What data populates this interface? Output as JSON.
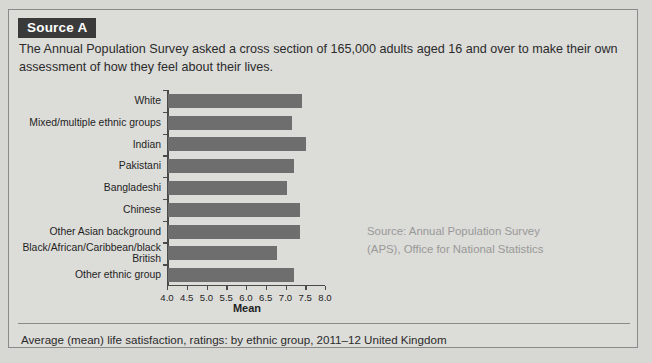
{
  "source": {
    "badge_label": "Source A",
    "intro_text": "The Annual Population Survey asked a cross section of 165,000 adults aged 16 and over to make their own assessment of how they feel about their lives.",
    "attribution_line1": "Source: Annual Population Survey",
    "attribution_line2": "(APS), Office for National Statistics",
    "caption": "Average (mean) life satisfaction, ratings: by ethnic group, 2011–12 United Kingdom"
  },
  "colors": {
    "bar": "#6e6e6e",
    "badge_bg": "#3a3a3a",
    "badge_text": "#ffffff",
    "panel_bg": "#dcdcd9",
    "border": "#8a8a88",
    "axis": "#4a4a4a",
    "attribution_text": "#999997"
  },
  "chart_data": {
    "type": "bar",
    "orientation": "horizontal",
    "title": "",
    "xlabel": "Mean",
    "ylabel": "",
    "xlim": [
      4.0,
      8.0
    ],
    "grid": false,
    "legend": false,
    "xticks": [
      "4.0",
      "4.5",
      "5.0",
      "5.5",
      "6.0",
      "6.5",
      "7.0",
      "7.5",
      "8.0"
    ],
    "xtick_values": [
      4.0,
      4.5,
      5.0,
      5.5,
      6.0,
      6.5,
      7.0,
      7.5,
      8.0
    ],
    "categories": [
      "White",
      "Mixed/multiple ethnic groups",
      "Indian",
      "Pakistani",
      "Bangladeshi",
      "Chinese",
      "Other Asian background",
      "Black/African/Caribbean/black British",
      "Other ethnic group"
    ],
    "values": [
      7.4,
      7.15,
      7.5,
      7.2,
      7.0,
      7.35,
      7.35,
      6.75,
      7.2
    ]
  }
}
